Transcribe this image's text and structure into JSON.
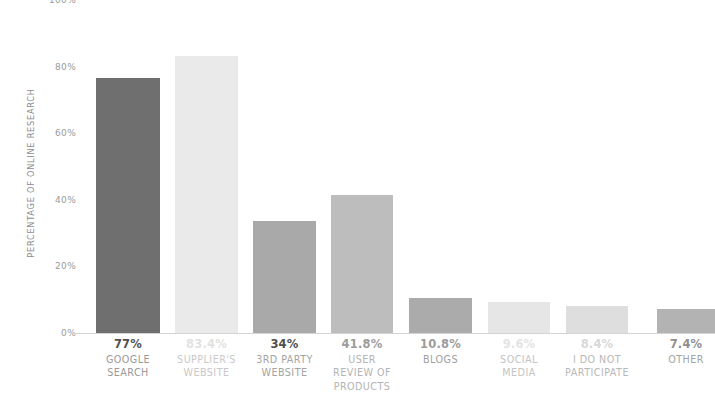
{
  "chart_data": {
    "type": "bar",
    "title": "",
    "subtitle": "",
    "xlabel": "",
    "ylabel": "PERCENTAGE OF ONLINE RESEARCH",
    "ylim": [
      0,
      100
    ],
    "y_ticks": [
      "0%",
      "20%",
      "40%",
      "60%",
      "80%",
      "100%"
    ],
    "y_tick_values": [
      0,
      20,
      40,
      60,
      80,
      100
    ],
    "grid": false,
    "legend": "none",
    "categories": [
      "GOOGLE SEARCH",
      "SUPPLIER'S WEBSITE",
      "3RD PARTY WEBSITE",
      "USER REVIEW OF PRODUCTS",
      "BLOGS",
      "SOCIAL MEDIA",
      "I DO NOT PARTICIPATE",
      "OTHER"
    ],
    "values": [
      77,
      83.4,
      34,
      41.8,
      10.8,
      9.6,
      8.4,
      7.4
    ],
    "value_labels": [
      "77%",
      "83.4%",
      "34%",
      "41.8%",
      "10.8%",
      "9.6%",
      "8.4%",
      "7.4%"
    ],
    "bar_colors": [
      "#6f6f6f",
      "#eaeaea",
      "#a9a9a9",
      "#bdbdbd",
      "#ababab",
      "#e6e6e6",
      "#dedede",
      "#b3b3b3"
    ],
    "bars": [
      {
        "label_lines": [
          "GOOGLE",
          "SEARCH"
        ],
        "value_label": "77%",
        "value": 77,
        "color": "#6f6f6f",
        "x": 6,
        "width": 64
      },
      {
        "label_lines": [
          "SUPPLIER'S",
          "WEBSITE"
        ],
        "value_label": "83.4%",
        "value": 83.4,
        "color": "#eaeaea",
        "x": 85,
        "width": 63
      },
      {
        "label_lines": [
          "3RD PARTY",
          "WEBSITE"
        ],
        "value_label": "34%",
        "value": 34,
        "color": "#a9a9a9",
        "x": 163,
        "width": 63
      },
      {
        "label_lines": [
          "USER",
          "REVIEW OF",
          "PRODUCTS"
        ],
        "value_label": "41.8%",
        "value": 41.8,
        "color": "#bdbdbd",
        "x": 241,
        "width": 62
      },
      {
        "label_lines": [
          "BLOGS"
        ],
        "value_label": "10.8%",
        "value": 10.8,
        "color": "#ababab",
        "x": 319,
        "width": 63
      },
      {
        "label_lines": [
          "SOCIAL",
          "MEDIA"
        ],
        "value_label": "9.6%",
        "value": 9.6,
        "color": "#e6e6e6",
        "x": 398,
        "width": 62
      },
      {
        "label_lines": [
          "I DO NOT",
          "PARTICIPATE"
        ],
        "value_label": "8.4%",
        "value": 8.4,
        "color": "#dedede",
        "x": 476,
        "width": 62
      },
      {
        "label_lines": [
          "OTHER"
        ],
        "value_label": "7.4%",
        "value": 7.4,
        "color": "#b3b3b3",
        "x": 567,
        "width": 58
      }
    ],
    "value_label_colors": [
      "#4f4f4f",
      "#e2e2e2",
      "#4f4f4f",
      "#9c9c9c",
      "#9c9c9c",
      "#e4e4e4",
      "#d8d8d8",
      "#8f8f8f"
    ],
    "category_label_colors": [
      "#9a9a9a",
      "#c9c9c9",
      "#a4a4a4",
      "#b4b4b4",
      "#a0a0a0",
      "#c4c4c4",
      "#b8b8b8",
      "#a2a2a2"
    ]
  }
}
